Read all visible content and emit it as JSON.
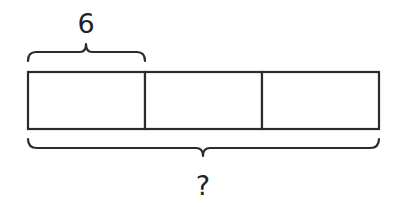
{
  "diagram": {
    "type": "tape-diagram",
    "part_count": 3,
    "part_label": "6",
    "whole_label": "?",
    "colors": {
      "stroke": "#2b2b2b",
      "background": "#ffffff",
      "text": "#222222"
    }
  }
}
